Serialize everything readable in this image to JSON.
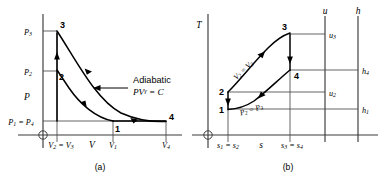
{
  "figure": {
    "background_color": "#ffffff",
    "line_color": "#000000",
    "axis_color": "#3a3a3a",
    "guide_color": "#4a4a4a"
  },
  "panel_a": {
    "caption": "(a)",
    "y_axis_label": "P",
    "x_axis_label": "V",
    "y_ticks": [
      {
        "id": "p3",
        "label": "P",
        "subscript": "3"
      },
      {
        "id": "p2",
        "label": "P",
        "subscript": "2"
      },
      {
        "id": "p1p4",
        "label": "P₁ = P₄"
      }
    ],
    "x_ticks": [
      {
        "id": "v2v3",
        "label": "V₂ = V₃"
      },
      {
        "id": "v1",
        "label": "V",
        "subscript": "1"
      },
      {
        "id": "v4",
        "label": "V",
        "subscript": "4"
      }
    ],
    "state_points": [
      {
        "id": "1",
        "label": "1"
      },
      {
        "id": "2",
        "label": "2"
      },
      {
        "id": "3",
        "label": "3"
      },
      {
        "id": "4",
        "label": "4"
      }
    ],
    "annotation": {
      "title": "Adiabatic",
      "equation_lhs": "PV",
      "equation_exponent": "γ",
      "equation_rhs": " = C"
    },
    "origin_marker": "circled-crosshair-origin"
  },
  "panel_b": {
    "caption": "(b)",
    "y_axis_label": "T",
    "x_axis_label": "s",
    "u_axis_label": "u",
    "h_axis_label": "h",
    "x_ticks": [
      {
        "id": "s1s2",
        "label": "s₁ = s₂"
      },
      {
        "id": "s3s4",
        "label": "s₃ = s₄"
      }
    ],
    "u_ticks": [
      {
        "id": "u3",
        "label": "u",
        "subscript": "3"
      },
      {
        "id": "u2",
        "label": "u",
        "subscript": "2"
      }
    ],
    "h_ticks": [
      {
        "id": "h4",
        "label": "h",
        "subscript": "4"
      },
      {
        "id": "h1",
        "label": "h",
        "subscript": "1"
      }
    ],
    "state_points": [
      {
        "id": "1",
        "label": "1"
      },
      {
        "id": "2",
        "label": "2"
      },
      {
        "id": "3",
        "label": "3"
      },
      {
        "id": "4",
        "label": "4"
      }
    ],
    "curve_labels": [
      {
        "id": "v2v3",
        "label": "V₂ = V₃"
      },
      {
        "id": "p2p3",
        "label": "P₂ = P₃"
      }
    ],
    "origin_marker": "circled-crosshair-origin"
  }
}
